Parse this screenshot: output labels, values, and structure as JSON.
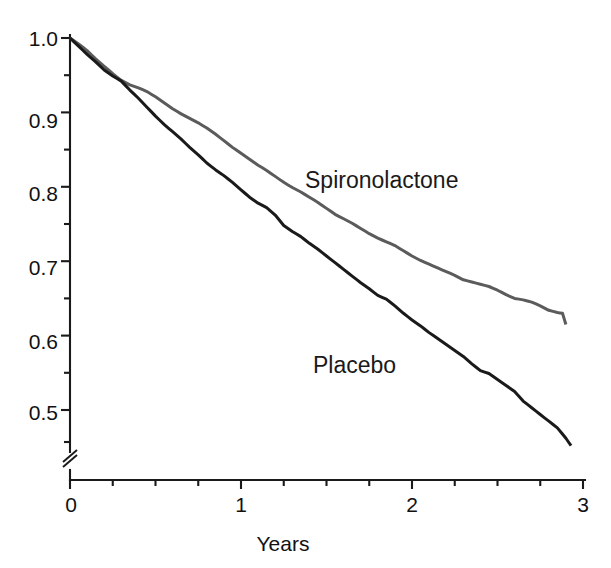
{
  "chart_data": {
    "type": "line",
    "title": "",
    "subtitle": "",
    "xlabel": "Years",
    "ylabel": "",
    "xlim": [
      0,
      3
    ],
    "ylim": [
      0.45,
      1.0
    ],
    "y_axis_break": true,
    "y_axis_break_note": "axis broken below 0.45",
    "grid": false,
    "legend_position": "inline-annotation",
    "x_ticks_major": [
      0,
      1,
      2,
      3
    ],
    "x_tick_labels": [
      "0",
      "1",
      "2",
      "3"
    ],
    "x_ticks_minor": [
      0.25,
      0.5,
      0.75,
      1.25,
      1.5,
      1.75,
      2.25,
      2.5,
      2.75
    ],
    "y_ticks_major": [
      0.5,
      0.6,
      0.7,
      0.8,
      0.9,
      1.0
    ],
    "y_tick_labels": [
      "0.5",
      "0.6",
      "0.7",
      "0.8",
      "0.9",
      "1.0"
    ],
    "y_ticks_minor": [
      0.45,
      0.55,
      0.65,
      0.75,
      0.85,
      0.95
    ],
    "series": [
      {
        "name": "Spironolactone",
        "color": "#5b5b5b",
        "label_position": {
          "x": 1.36,
          "y": 0.795
        },
        "x": [
          0,
          0.05,
          0.1,
          0.15,
          0.2,
          0.25,
          0.3,
          0.35,
          0.4,
          0.45,
          0.5,
          0.55,
          0.6,
          0.65,
          0.7,
          0.75,
          0.8,
          0.85,
          0.9,
          0.95,
          1.0,
          1.05,
          1.1,
          1.15,
          1.2,
          1.25,
          1.3,
          1.35,
          1.4,
          1.45,
          1.5,
          1.55,
          1.6,
          1.65,
          1.7,
          1.75,
          1.8,
          1.85,
          1.9,
          1.95,
          2.0,
          2.05,
          2.1,
          2.15,
          2.2,
          2.25,
          2.3,
          2.35,
          2.4,
          2.45,
          2.5,
          2.55,
          2.6,
          2.65,
          2.7,
          2.75,
          2.8,
          2.85,
          2.88,
          2.9
        ],
        "y": [
          1.0,
          0.992,
          0.983,
          0.972,
          0.962,
          0.952,
          0.943,
          0.937,
          0.933,
          0.928,
          0.921,
          0.913,
          0.905,
          0.898,
          0.892,
          0.886,
          0.879,
          0.871,
          0.862,
          0.853,
          0.845,
          0.837,
          0.829,
          0.822,
          0.814,
          0.806,
          0.799,
          0.793,
          0.786,
          0.779,
          0.771,
          0.763,
          0.757,
          0.751,
          0.744,
          0.737,
          0.731,
          0.726,
          0.721,
          0.714,
          0.707,
          0.701,
          0.696,
          0.691,
          0.686,
          0.681,
          0.675,
          0.672,
          0.669,
          0.666,
          0.661,
          0.655,
          0.65,
          0.648,
          0.645,
          0.64,
          0.634,
          0.631,
          0.63,
          0.615
        ]
      },
      {
        "name": "Placebo",
        "color": "#1a1a1a",
        "label_position": {
          "x": 1.47,
          "y": 0.565
        },
        "x": [
          0,
          0.05,
          0.1,
          0.15,
          0.2,
          0.25,
          0.3,
          0.35,
          0.4,
          0.45,
          0.5,
          0.55,
          0.6,
          0.65,
          0.7,
          0.75,
          0.8,
          0.85,
          0.9,
          0.95,
          1.0,
          1.05,
          1.1,
          1.15,
          1.2,
          1.25,
          1.3,
          1.35,
          1.4,
          1.45,
          1.5,
          1.55,
          1.6,
          1.65,
          1.7,
          1.75,
          1.8,
          1.85,
          1.9,
          1.95,
          2.0,
          2.05,
          2.1,
          2.15,
          2.2,
          2.25,
          2.3,
          2.35,
          2.4,
          2.45,
          2.5,
          2.55,
          2.6,
          2.65,
          2.7,
          2.75,
          2.8,
          2.85,
          2.9,
          2.93
        ],
        "y": [
          1.0,
          0.989,
          0.978,
          0.968,
          0.957,
          0.949,
          0.942,
          0.93,
          0.919,
          0.907,
          0.895,
          0.884,
          0.874,
          0.864,
          0.853,
          0.843,
          0.832,
          0.823,
          0.815,
          0.806,
          0.796,
          0.786,
          0.778,
          0.772,
          0.762,
          0.748,
          0.74,
          0.733,
          0.724,
          0.716,
          0.707,
          0.698,
          0.689,
          0.68,
          0.671,
          0.663,
          0.654,
          0.649,
          0.64,
          0.63,
          0.621,
          0.613,
          0.604,
          0.596,
          0.588,
          0.58,
          0.572,
          0.562,
          0.553,
          0.549,
          0.541,
          0.533,
          0.525,
          0.512,
          0.503,
          0.494,
          0.485,
          0.476,
          0.462,
          0.452
        ]
      }
    ]
  },
  "axis": {
    "x_title": "Years",
    "x_labels": [
      "0",
      "1",
      "2",
      "3"
    ],
    "y_labels": [
      "1.0",
      "0.9",
      "0.8",
      "0.7",
      "0.6",
      "0.5"
    ]
  },
  "annotations": {
    "spironolactone_label": "Spironolactone",
    "placebo_label": "Placebo"
  },
  "colors": {
    "spironolactone": "#5b5b5b",
    "placebo": "#1a1a1a",
    "axis": "#1a1a1a",
    "background": "#ffffff"
  }
}
